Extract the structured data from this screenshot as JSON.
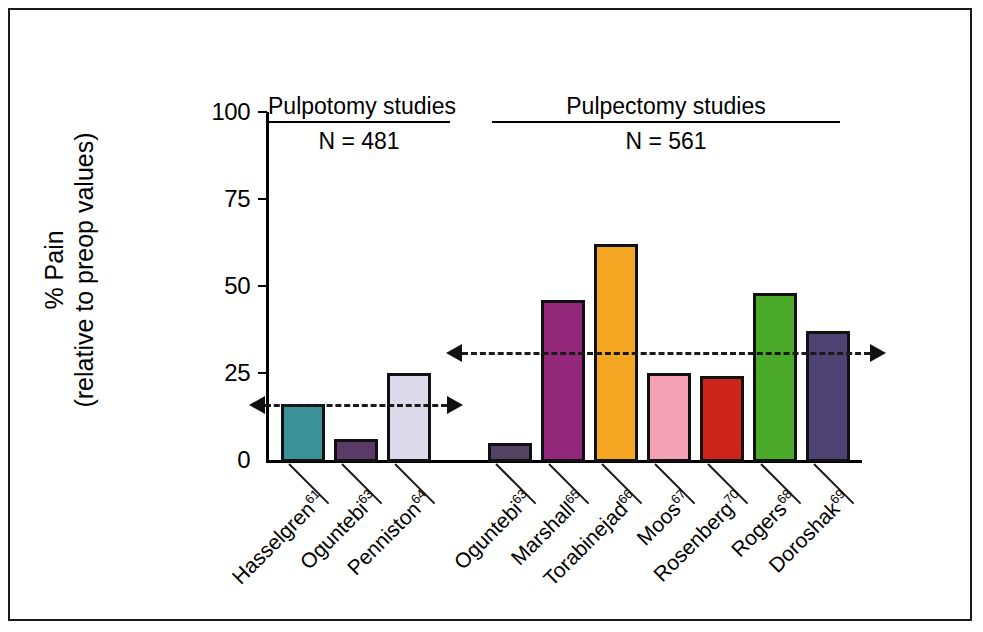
{
  "chart_data": {
    "type": "bar",
    "title": "",
    "subtitle": "",
    "xlabel": "",
    "ylabel_line1": "% Pain",
    "ylabel_line2": "(relative to preop values)",
    "ylim": [
      0,
      100
    ],
    "yticks": [
      "0",
      "25",
      "50",
      "75",
      "100"
    ],
    "ytick_values": [
      0,
      25,
      50,
      75,
      100
    ],
    "grid": false,
    "legend": "none",
    "groups": [
      {
        "name": "pulpotomy",
        "title": "Pulpotomy studies",
        "n_label": "N = 481",
        "n_value": 481,
        "mean_line_value": 16,
        "mean_line_arrows": "both",
        "bars": [
          {
            "label": "Hasselgren",
            "ref": "61",
            "value": 16,
            "color": "#3b9198"
          },
          {
            "label": "Oguntebi",
            "ref": "63",
            "value": 6,
            "color": "#5a3a66"
          },
          {
            "label": "Penniston",
            "ref": "64",
            "value": 25,
            "color": "#dcdaea"
          }
        ]
      },
      {
        "name": "pulpectomy",
        "title": "Pulpectomy studies",
        "n_label": "N = 561",
        "n_value": 561,
        "mean_line_value": 31,
        "mean_line_arrows": "both",
        "bars": [
          {
            "label": "Oguntebi",
            "ref": "63",
            "value": 5,
            "color": "#534363"
          },
          {
            "label": "Marshall",
            "ref": "65",
            "value": 46,
            "color": "#93287a"
          },
          {
            "label": "Torabinejad",
            "ref": "66",
            "value": 62,
            "color": "#f5a623"
          },
          {
            "label": "Moos",
            "ref": "67",
            "value": 25,
            "color": "#f4a0b5"
          },
          {
            "label": "Rosenberg",
            "ref": "70",
            "value": 24,
            "color": "#cc2418"
          },
          {
            "label": "Rogers",
            "ref": "68",
            "value": 48,
            "color": "#4aa929"
          },
          {
            "label": "Doroshak",
            "ref": "69",
            "value": 37,
            "color": "#4e4273"
          }
        ]
      }
    ]
  },
  "colors": {
    "axis": "#000000",
    "bar_outline": "#111111",
    "frame": "#1a1a1a",
    "background": "#ffffff"
  }
}
